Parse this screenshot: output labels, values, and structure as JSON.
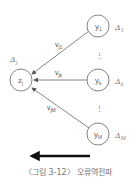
{
  "diagram": {
    "hidden_node": {
      "label": "z",
      "sub": "j",
      "delta": "Δ",
      "delta_sub": "j"
    },
    "output_nodes": [
      {
        "label": "y",
        "sub": "1",
        "delta": "Δ",
        "delta_sub": "1"
      },
      {
        "label": "y",
        "sub": "k",
        "delta": "Δ",
        "delta_sub": "k"
      },
      {
        "label": "y",
        "sub": "M",
        "delta": "Δ",
        "delta_sub": "M"
      }
    ],
    "weights": [
      {
        "label": "v",
        "sub": "j1"
      },
      {
        "label": "v",
        "sub": "jk"
      },
      {
        "label": "v",
        "sub": "jM"
      }
    ],
    "ellipsis": "⋮",
    "direction_arrow": "left"
  },
  "caption": "〈그림 3-12〉 오류역전파"
}
